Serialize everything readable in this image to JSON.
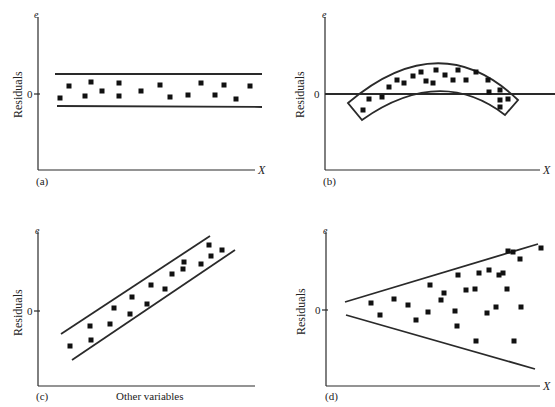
{
  "chart_data": [
    {
      "panel": "(a)",
      "type": "scatter",
      "title": "",
      "ylabel": "Residuals",
      "y_axis_symbol": "e",
      "xlabel": "X",
      "y_tick": "0",
      "pattern": "horizontal band (constant variance)",
      "bands": [
        {
          "x1": 55,
          "y1": 74,
          "x2": 262,
          "y2": 74
        },
        {
          "x1": 57,
          "y1": 106,
          "x2": 262,
          "y2": 107
        }
      ],
      "points": [
        [
          60,
          98
        ],
        [
          69,
          86
        ],
        [
          85,
          96
        ],
        [
          91,
          82
        ],
        [
          102,
          91
        ],
        [
          119,
          83
        ],
        [
          119,
          96
        ],
        [
          141,
          91
        ],
        [
          160,
          85
        ],
        [
          170,
          97
        ],
        [
          188,
          95
        ],
        [
          201,
          83
        ],
        [
          215,
          95
        ],
        [
          224,
          85
        ],
        [
          236,
          99
        ],
        [
          250,
          86
        ]
      ]
    },
    {
      "panel": "(b)",
      "type": "scatter",
      "ylabel": "Residuals",
      "y_axis_symbol": "e",
      "xlabel": "X",
      "y_tick": "0",
      "pattern": "curved band (nonlinearity)",
      "points": [
        [
          363,
          110
        ],
        [
          369,
          99
        ],
        [
          382,
          97
        ],
        [
          389,
          87
        ],
        [
          397,
          80
        ],
        [
          404,
          83
        ],
        [
          413,
          76
        ],
        [
          421,
          72
        ],
        [
          426,
          81
        ],
        [
          436,
          70
        ],
        [
          433,
          83
        ],
        [
          445,
          75
        ],
        [
          453,
          80
        ],
        [
          458,
          70
        ],
        [
          466,
          80
        ],
        [
          476,
          72
        ],
        [
          488,
          80
        ],
        [
          489,
          92
        ],
        [
          500,
          90
        ],
        [
          500,
          100
        ],
        [
          508,
          99
        ],
        [
          500,
          107
        ]
      ]
    },
    {
      "panel": "(c)",
      "type": "scatter",
      "ylabel": "Residuals",
      "y_axis_symbol": "e",
      "xlabel": "Other variables",
      "y_tick": "0",
      "pattern": "linear trend band",
      "bands": [
        {
          "x1": 61,
          "y1": 334,
          "x2": 210,
          "y2": 236
        },
        {
          "x1": 72,
          "y1": 360,
          "x2": 235,
          "y2": 250
        }
      ],
      "points": [
        [
          70,
          346
        ],
        [
          90,
          326
        ],
        [
          91,
          340
        ],
        [
          110,
          324
        ],
        [
          114,
          308
        ],
        [
          130,
          314
        ],
        [
          132,
          297
        ],
        [
          147,
          304
        ],
        [
          151,
          285
        ],
        [
          165,
          289
        ],
        [
          172,
          274
        ],
        [
          183,
          269
        ],
        [
          184,
          262
        ],
        [
          201,
          264
        ],
        [
          209,
          245
        ],
        [
          211,
          256
        ],
        [
          222,
          250
        ]
      ]
    },
    {
      "panel": "(d)",
      "type": "scatter",
      "ylabel": "Residuals",
      "y_axis_symbol": "e",
      "xlabel": "X",
      "y_tick": "0",
      "pattern": "widening funnel (heteroscedasticity)",
      "bands": [
        {
          "x1": 345,
          "y1": 302,
          "x2": 538,
          "y2": 244
        },
        {
          "x1": 346,
          "y1": 315,
          "x2": 535,
          "y2": 369
        }
      ],
      "points": [
        [
          371,
          303
        ],
        [
          380,
          315
        ],
        [
          394,
          299
        ],
        [
          416,
          320
        ],
        [
          408,
          305
        ],
        [
          430,
          285
        ],
        [
          428,
          312
        ],
        [
          441,
          300
        ],
        [
          444,
          293
        ],
        [
          457,
          326
        ],
        [
          458,
          275
        ],
        [
          455,
          311
        ],
        [
          466,
          290
        ],
        [
          475,
          289
        ],
        [
          479,
          273
        ],
        [
          476,
          341
        ],
        [
          487,
          313
        ],
        [
          489,
          270
        ],
        [
          496,
          307
        ],
        [
          499,
          275
        ],
        [
          503,
          273
        ],
        [
          507,
          289
        ],
        [
          508,
          251
        ],
        [
          513,
          252
        ],
        [
          514,
          341
        ],
        [
          520,
          259
        ],
        [
          521,
          307
        ],
        [
          541,
          248
        ]
      ]
    }
  ],
  "panels": {
    "a": {
      "tag": "(a)",
      "ylabel": "Residuals",
      "ysym": "e",
      "zero": "0",
      "xsym": "X"
    },
    "b": {
      "tag": "(b)",
      "ylabel": "Residuals",
      "ysym": "e",
      "zero": "0",
      "xsym": "X"
    },
    "c": {
      "tag": "(c)",
      "ylabel": "Residuals",
      "ysym": "e",
      "zero": "0",
      "xlabel": "Other variables"
    },
    "d": {
      "tag": "(d)",
      "ylabel": "Residuals",
      "ysym": "e",
      "zero": "0",
      "xsym": "X"
    }
  }
}
